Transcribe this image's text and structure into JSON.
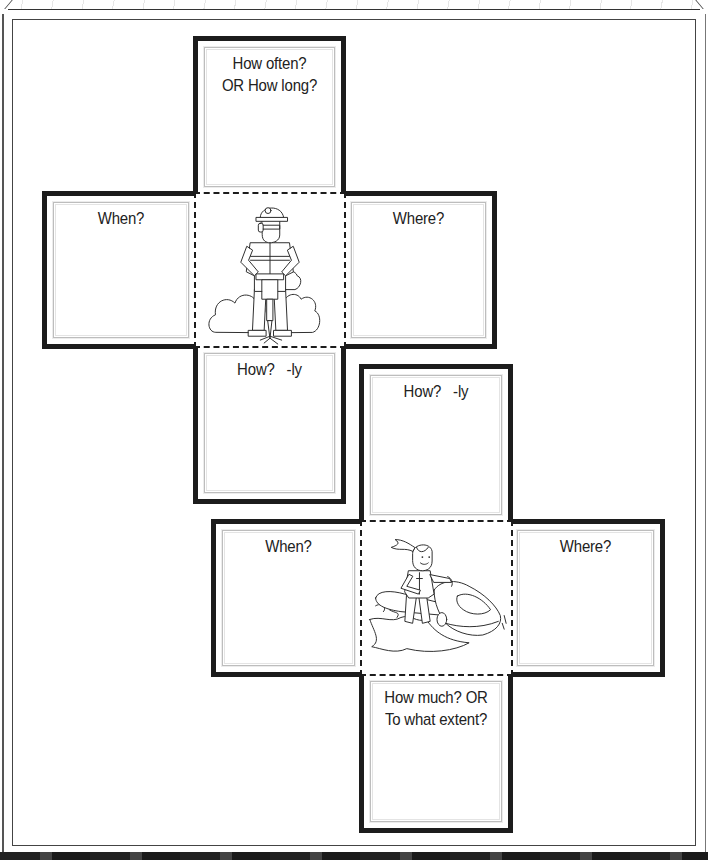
{
  "cubes": [
    {
      "name": "cube-net-1",
      "center_illustration": "construction-worker-jackhammer-icon",
      "panels": {
        "top": {
          "lines": [
            "How often?",
            "OR How long?"
          ]
        },
        "left": {
          "lines": [
            "When?"
          ]
        },
        "right": {
          "lines": [
            "Where?"
          ]
        },
        "bottom": {
          "lines": [
            "How?   -ly"
          ]
        }
      }
    },
    {
      "name": "cube-net-2",
      "center_illustration": "girl-on-jet-ski-icon",
      "panels": {
        "top": {
          "lines": [
            "How?   -ly"
          ]
        },
        "left": {
          "lines": [
            "When?"
          ]
        },
        "right": {
          "lines": [
            "Where?"
          ]
        },
        "bottom": {
          "lines": [
            "How much? OR",
            "To what extent?"
          ]
        }
      }
    }
  ],
  "colors": {
    "outline": "#1c1c1c",
    "inner_wavy_frame": "#bdbdbd",
    "text": "#222222",
    "background": "#ffffff"
  }
}
